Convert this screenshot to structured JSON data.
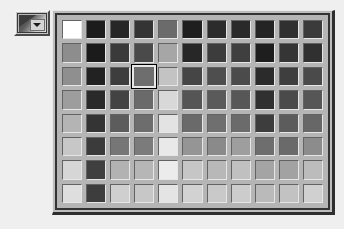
{
  "window": {
    "background_color": "#efefef"
  },
  "toolbar": {
    "palette_button": {
      "name": "Fill Color",
      "icon": "gradient-swatch-icon",
      "dropdown_icon": "dropdown-arrow-icon",
      "state": "pressed"
    }
  },
  "palette": {
    "title": "Color Palette",
    "columns": 11,
    "rows": 8,
    "border_color": "#333333",
    "panel_background": "#b5b5b5",
    "selection_border_color": "#000000",
    "selection_highlight_color": "#e8e8e8",
    "selected_index": 25,
    "selected_row": 3,
    "selected_column": 4,
    "selected_color": "#6e6e6e",
    "swatches": [
      "#ffffff",
      "#1c1c1c",
      "#262626",
      "#343434",
      "#6b6b6b",
      "#1f1f1f",
      "#2c2c2c",
      "#2a2a2a",
      "#242424",
      "#303030",
      "#3b3b3b",
      "#8d8d8d",
      "#1b1b1b",
      "#3a3a3a",
      "#4a4a4a",
      "#a6a6a6",
      "#272727",
      "#3c3c3c",
      "#3f3f3f",
      "#1e1e1e",
      "#353535",
      "#303030",
      "#8f8f8f",
      "#222222",
      "#3d3d3d",
      "#6e6e6e",
      "#c3c3c3",
      "#454545",
      "#4e4e4e",
      "#4b4b4b",
      "#2b2b2b",
      "#3e3e3e",
      "#4a4a4a",
      "#9d9d9d",
      "#2a2a2a",
      "#434343",
      "#6a6a6a",
      "#d8d8d8",
      "#555555",
      "#5a5a5a",
      "#575757",
      "#303030",
      "#4a4a4a",
      "#565656",
      "#b4b4b4",
      "#343434",
      "#5c5c5c",
      "#6d6d6d",
      "#e3e3e3",
      "#6a6a6a",
      "#6f6f6f",
      "#6b6b6b",
      "#3d3d3d",
      "#5c5c5c",
      "#676767",
      "#c7c7c7",
      "#3b3b3b",
      "#767676",
      "#7b7b7b",
      "#e9e9e9",
      "#959595",
      "#8a8a8a",
      "#9e9e9e",
      "#6e6e6e",
      "#6a6a6a",
      "#8c8c8c",
      "#d6d6d6",
      "#3f3f3f",
      "#b2b2b2",
      "#b6b6b6",
      "#ececec",
      "#c6c6c6",
      "#b8b8b8",
      "#c0c0c0",
      "#a4a4a4",
      "#a2a2a2",
      "#bcbcbc",
      "#dedede",
      "#3d3d3d",
      "#cfcfcf",
      "#c7c7c7",
      "#e4e4e4",
      "#d2d2d2",
      "#c9c9c9",
      "#cccccc",
      "#bababa",
      "#c2c2c2",
      "#d0d0d0"
    ]
  }
}
